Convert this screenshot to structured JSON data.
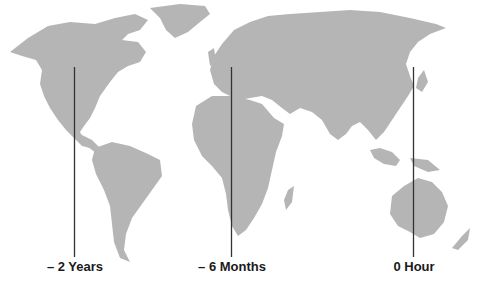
{
  "colors": {
    "land": "#b5b5b5",
    "line": "#333333",
    "text": "#1a1a1a",
    "background": "#ffffff"
  },
  "markers": [
    {
      "label": "– 2 Years",
      "region": "North America"
    },
    {
      "label": "– 6 Months",
      "region": "Europe / Africa"
    },
    {
      "label": "0 Hour",
      "region": "East Asia / Australia"
    }
  ]
}
